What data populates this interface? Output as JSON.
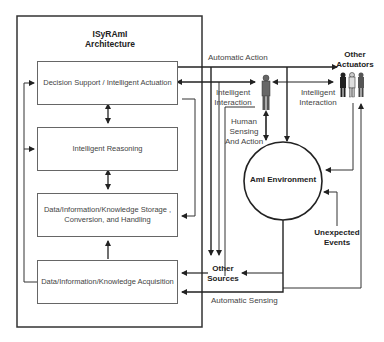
{
  "architecture": {
    "title_line1": "ISyRAmI",
    "title_line2": "Architecture",
    "modules": [
      {
        "label": "Decision Support / Intelligent Actuation"
      },
      {
        "label": "Intelligent Reasoning"
      },
      {
        "label_line1": "Data/Information/Knowledge Storage ,",
        "label_line2": "Conversion, and Handling"
      },
      {
        "label": "Data/Information/Knowledge Acquisition"
      }
    ]
  },
  "environment": {
    "label": "AmI Environment"
  },
  "nodes": {
    "other_actuators_line1": "Other",
    "other_actuators_line2": "Actuators",
    "other_sources_line1": "Other",
    "other_sources_line2": "Sources",
    "unexpected_events_line1": "Unexpected",
    "unexpected_events_line2": "Events"
  },
  "edges": {
    "automatic_action": "Automatic Action",
    "intelligent_interaction_left_line1": "Intelligent",
    "intelligent_interaction_left_line2": "Interaction",
    "intelligent_interaction_right_line1": "Intelligent",
    "intelligent_interaction_right_line2": "Interaction",
    "human_sensing_line1": "Human",
    "human_sensing_line2": "Sensing",
    "human_sensing_line3": "And Action",
    "automatic_sensing": "Automatic Sensing"
  }
}
